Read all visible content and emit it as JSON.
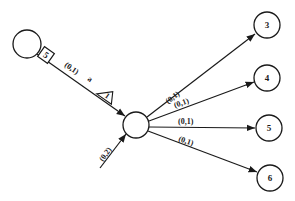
{
  "diagram": {
    "type": "network-graph",
    "nodes": [
      {
        "id": "left",
        "label": "",
        "cx": 27,
        "cy": 44,
        "r": 14
      },
      {
        "id": "center",
        "label": "",
        "cx": 136,
        "cy": 125,
        "r": 13
      },
      {
        "id": "n3",
        "label": "3",
        "cx": 267,
        "cy": 25,
        "r": 13
      },
      {
        "id": "n4",
        "label": "4",
        "cx": 267,
        "cy": 78,
        "r": 13
      },
      {
        "id": "n5",
        "label": "5",
        "cx": 269,
        "cy": 128,
        "r": 13
      },
      {
        "id": "n6",
        "label": "6",
        "cx": 270,
        "cy": 178,
        "r": 13
      }
    ],
    "edges": [
      {
        "from": "left",
        "to": "center",
        "label": "(0,1)",
        "box_marker": "5",
        "mid_marker": "a",
        "triangle_marker": "1"
      },
      {
        "from": "external",
        "to": "center",
        "label": "(0,2)"
      },
      {
        "from": "center",
        "to": "n3",
        "label": "(0,1)"
      },
      {
        "from": "center",
        "to": "n4",
        "label": "(0,1)"
      },
      {
        "from": "center",
        "to": "n5",
        "label": "(0,1)"
      },
      {
        "from": "center",
        "to": "n6",
        "label": "(0,1)"
      }
    ]
  }
}
